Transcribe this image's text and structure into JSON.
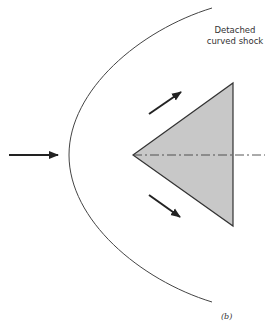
{
  "diagram": {
    "shock_label_line1": "Detached",
    "shock_label_line2": "curved shock",
    "figure_label": "(b)",
    "colors": {
      "line": "#333333",
      "wedge_fill": "#c8c8c8",
      "axis": "#555555"
    },
    "wedge": {
      "apex": [
        133,
        155
      ],
      "top": [
        233,
        83
      ],
      "bottom": [
        233,
        226
      ]
    },
    "shock_curve": {
      "start": [
        212,
        8
      ],
      "vertex": [
        69,
        155
      ],
      "end": [
        212,
        302
      ]
    },
    "arrows": [
      {
        "name": "freestream",
        "from": [
          9,
          155
        ],
        "to": [
          58,
          155
        ]
      },
      {
        "name": "upper-deflected-flow",
        "from": [
          149,
          114
        ],
        "to": [
          181,
          92
        ]
      },
      {
        "name": "lower-deflected-flow",
        "from": [
          149,
          195
        ],
        "to": [
          180,
          217
        ]
      }
    ],
    "centerline": {
      "from": [
        133,
        155
      ],
      "to": [
        265,
        155
      ]
    }
  }
}
